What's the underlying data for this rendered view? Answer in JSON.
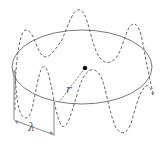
{
  "diagram": {
    "orbit": {
      "cx": 82,
      "cy": 67,
      "rx": 70,
      "ry": 37,
      "color": "#777777"
    },
    "nucleus": {
      "x": 85,
      "y": 68,
      "color": "#111111"
    },
    "wave": {
      "color": "#666666",
      "style": "dashed"
    },
    "labels": {
      "radius": "r",
      "wavelength": "λ"
    }
  }
}
